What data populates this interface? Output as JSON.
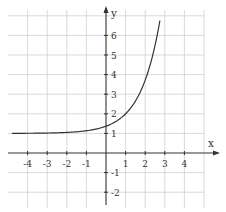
{
  "chart_data": {
    "type": "line",
    "title": "",
    "xlabel": "x",
    "ylabel": "y",
    "xlim": [
      -4.9,
      5.0
    ],
    "ylim": [
      -2.6,
      7.2
    ],
    "grid": true,
    "legend": null,
    "x_ticks": [
      -4,
      -3,
      -2,
      -1,
      1,
      2,
      3,
      4
    ],
    "x_tick_labels": [
      "-4",
      "-3",
      "-2",
      "-1",
      "1",
      "2",
      "3",
      "4"
    ],
    "y_ticks": [
      -2,
      -1,
      1,
      2,
      3,
      4,
      5,
      6
    ],
    "y_tick_labels": [
      "-2",
      "-1",
      "1",
      "2",
      "3",
      "4",
      "5",
      "6"
    ],
    "series": [
      {
        "name": "exponential curve (approx. y = e^(x-1) + 1)",
        "x": [
          -4.8,
          -4,
          -3,
          -2,
          -1,
          0,
          0.5,
          1,
          1.5,
          2,
          2.5,
          2.75
        ],
        "y": [
          1.0,
          1.01,
          1.02,
          1.05,
          1.14,
          1.37,
          1.61,
          2.0,
          2.65,
          3.72,
          5.48,
          6.75
        ]
      }
    ],
    "asymptote": {
      "y": 1,
      "note": "curve approaches y = 1 as x → -∞"
    }
  },
  "layout": {
    "origin_px": [
      106,
      153
    ],
    "unit_px": 19.6
  }
}
